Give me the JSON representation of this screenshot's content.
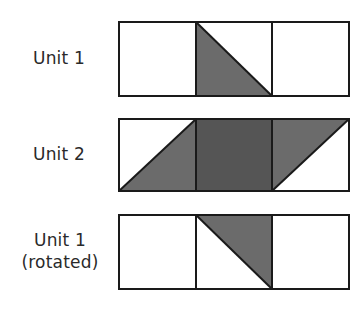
{
  "diagram": {
    "colors": {
      "stroke": "#1a1a1a",
      "triangle_fill": "#6b6b6b",
      "square_fill": "#555555",
      "background": "#ffffff"
    },
    "rows": [
      {
        "label_lines": [
          "Unit 1"
        ],
        "cells": [
          {
            "fill": "none"
          },
          {
            "fill": "triangle",
            "shaded_corner": "bottom-left",
            "diagonal": "top-left to bottom-right"
          },
          {
            "fill": "none"
          }
        ]
      },
      {
        "label_lines": [
          "Unit 2"
        ],
        "cells": [
          {
            "fill": "triangle",
            "shaded_corner": "bottom-right",
            "diagonal": "bottom-left to top-right"
          },
          {
            "fill": "square"
          },
          {
            "fill": "triangle",
            "shaded_corner": "top-left",
            "diagonal": "bottom-left to top-right"
          }
        ]
      },
      {
        "label_lines": [
          "Unit 1",
          "(rotated)"
        ],
        "cells": [
          {
            "fill": "none"
          },
          {
            "fill": "triangle",
            "shaded_corner": "top-right",
            "diagonal": "top-left to bottom-right"
          },
          {
            "fill": "none"
          }
        ]
      }
    ]
  }
}
